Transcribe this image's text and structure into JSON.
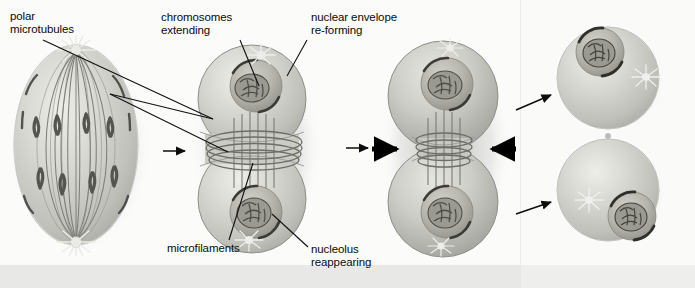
{
  "figure": {
    "stage_width": 695,
    "stage_height": 288
  },
  "colors": {
    "background": "#fbfbfa",
    "panel_right": "#fafaf9",
    "bottom_band": "#e8e8e6",
    "cell_fill": "#c9c9c4",
    "cell_fill_light": "#dcdcd7",
    "cell_edge": "#8f8f89",
    "nucleus_fill": "#b4b4ae",
    "chromatin": "#6a6a64",
    "nucleolus": "#57574f",
    "microtubule": "#7b7b75",
    "aster": "#e6e6e1",
    "label_text": "#0a0a0a",
    "leader_line": "#101010",
    "arrow": "#0d0d0d",
    "bold_arrow": "#000000"
  },
  "labels": [
    {
      "id": "polar-microtubules",
      "name": "label-polar-microtubules",
      "lines": [
        "polar",
        "microtubules"
      ],
      "text": "polar\nmicrotubules",
      "x": 10,
      "y": 10,
      "leader_targets": [
        [
          212,
          118
        ],
        [
          228,
          152
        ]
      ]
    },
    {
      "id": "chromosomes-extending",
      "name": "label-chromosomes-extending",
      "lines": [
        "chromosomes",
        "extending"
      ],
      "text": "chromosomes\nextending",
      "x": 161,
      "y": 11,
      "leader_targets": [
        [
          258,
          86
        ]
      ]
    },
    {
      "id": "nuclear-envelope-re-forming",
      "name": "label-nuclear-envelope-reforming",
      "lines": [
        "nuclear envelope",
        "re-forming"
      ],
      "text": "nuclear envelope\nre-forming",
      "x": 311,
      "y": 11,
      "leader_targets": [
        [
          286,
          75
        ]
      ]
    },
    {
      "id": "microfilaments",
      "name": "label-microfilaments",
      "lines": [
        "microfilaments"
      ],
      "text": "microfilaments",
      "x": 167,
      "y": 242,
      "leader_targets": [
        [
          252,
          164
        ]
      ]
    },
    {
      "id": "nucleolus-reappearing",
      "name": "label-nucleolus-reappearing",
      "lines": [
        "nucleolus",
        "reappearing"
      ],
      "text": "nucleolus\nreappearing",
      "x": 311,
      "y": 243,
      "leader_targets": [
        [
          272,
          215
        ]
      ]
    }
  ],
  "cells": [
    {
      "id": "cell-1",
      "name": "cell-telophase-spindle",
      "caption": "Telophase cell with full mitotic spindle, polar microtubules and chromosomes at both poles",
      "stage": "telophase"
    },
    {
      "id": "cell-2",
      "name": "cell-early-cytokinesis",
      "caption": "Early cytokinesis: nuclear envelopes re-forming, nucleoli reappearing, contractile ring of microfilaments forming",
      "stage": "early cytokinesis"
    },
    {
      "id": "cell-3",
      "name": "cell-cleavage-furrow",
      "caption": "Contractile ring tightening, cleavage furrow deepening (inward arrows show constriction)",
      "stage": "cleavage furrow"
    },
    {
      "id": "cell-4a",
      "name": "daughter-cell-upper",
      "caption": "Upper daughter cell with re-formed nucleus and centrosome aster",
      "stage": "daughter cell"
    },
    {
      "id": "cell-4b",
      "name": "daughter-cell-lower",
      "caption": "Lower daughter cell with re-formed nucleus and centrosome aster",
      "stage": "daughter cell"
    }
  ],
  "arrows": [
    {
      "id": "arrow-1",
      "name": "process-arrow-1",
      "from": "cell-1",
      "to": "cell-2",
      "style": "thin",
      "direction": "right"
    },
    {
      "id": "arrow-2",
      "name": "process-arrow-2",
      "from": "cell-2",
      "to": "cell-3",
      "style": "thin",
      "direction": "right"
    },
    {
      "id": "arrow-3",
      "name": "constriction-arrow-left",
      "style": "bold",
      "direction": "right",
      "note": "points inward at cleavage furrow from left"
    },
    {
      "id": "arrow-4",
      "name": "constriction-arrow-right",
      "style": "bold",
      "direction": "left",
      "note": "points inward at cleavage furrow from right"
    },
    {
      "id": "arrow-5",
      "name": "process-arrow-to-upper-daughter",
      "from": "cell-3",
      "to": "cell-4a",
      "style": "thin",
      "direction": "up-right"
    },
    {
      "id": "arrow-6",
      "name": "process-arrow-to-lower-daughter",
      "from": "cell-3",
      "to": "cell-4b",
      "style": "thin",
      "direction": "down-right"
    }
  ]
}
